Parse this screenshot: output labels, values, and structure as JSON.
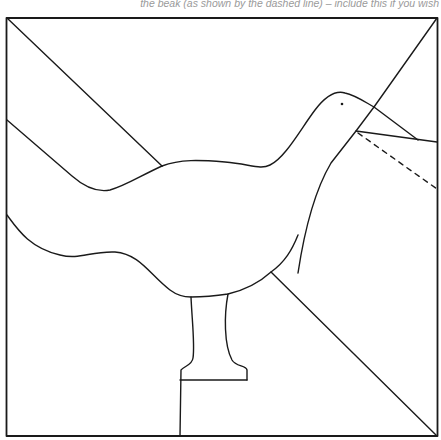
{
  "caption": "the beak (as shown by the dashed line) – include this if you wish",
  "diagram": {
    "type": "quilt-block-template",
    "stroke_color": "#1a1a1a",
    "background": "#ffffff",
    "parts": [
      "outer-square",
      "diagonal-top-left",
      "diagonal-top-right",
      "diagonal-bottom-right",
      "background-band",
      "goose-body",
      "goose-head",
      "eye",
      "beak",
      "beak-dashed-option",
      "leg",
      "foot"
    ]
  }
}
